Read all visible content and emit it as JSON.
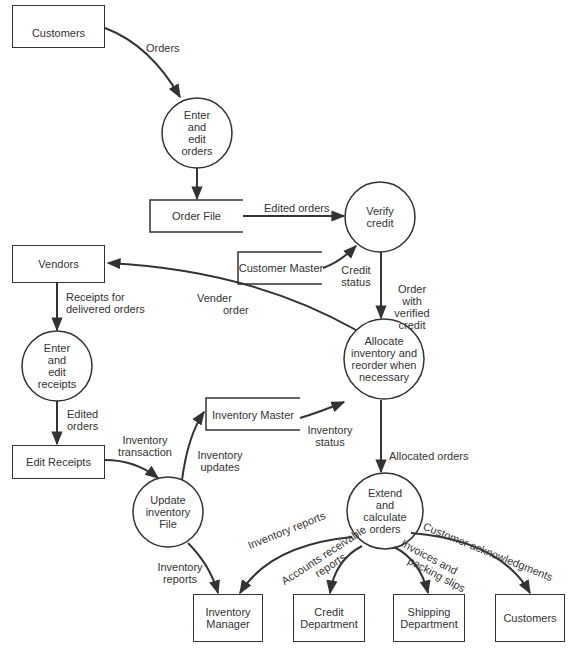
{
  "diagram": {
    "type": "data-flow-diagram",
    "external_entities": [
      {
        "id": "customers_top",
        "label": "Customers"
      },
      {
        "id": "vendors",
        "label": "Vendors"
      },
      {
        "id": "edit_receipts",
        "label": "Edit Receipts"
      },
      {
        "id": "inventory_manager",
        "label": "Inventory\nManager"
      },
      {
        "id": "credit_department",
        "label": "Credit\nDepartment"
      },
      {
        "id": "shipping_department",
        "label": "Shipping\nDepartment"
      },
      {
        "id": "customers_bottom",
        "label": "Customers"
      }
    ],
    "processes": [
      {
        "id": "enter_edit_orders",
        "label": "Enter\nand\nedit\norders"
      },
      {
        "id": "verify_credit",
        "label": "Verify\ncredit"
      },
      {
        "id": "enter_edit_receipts",
        "label": "Enter\nand\nedit\nreceipts"
      },
      {
        "id": "allocate_inventory",
        "label": "Allocate\ninventory and\nreorder when\nnecessary"
      },
      {
        "id": "update_inventory",
        "label": "Update\ninventory\nFile"
      },
      {
        "id": "extend_calculate",
        "label": "Extend\nand\ncalculate\norders"
      }
    ],
    "data_stores": [
      {
        "id": "order_file",
        "label": "Order File"
      },
      {
        "id": "customer_master",
        "label": "Customer Master"
      },
      {
        "id": "inventory_master",
        "label": "Inventory Master"
      }
    ],
    "flows": [
      {
        "from": "customers_top",
        "to": "enter_edit_orders",
        "label": "Orders"
      },
      {
        "from": "enter_edit_orders",
        "to": "order_file",
        "label": ""
      },
      {
        "from": "order_file",
        "to": "verify_credit",
        "label": "Edited orders"
      },
      {
        "from": "customer_master",
        "to": "verify_credit",
        "label": "Credit\nstatus"
      },
      {
        "from": "verify_credit",
        "to": "allocate_inventory",
        "label": "Order\nwith\nverified\ncredit"
      },
      {
        "from": "allocate_inventory",
        "to": "vendors",
        "label": "Vender\norder"
      },
      {
        "from": "vendors",
        "to": "enter_edit_receipts",
        "label": "Receipts for\ndelivered orders"
      },
      {
        "from": "enter_edit_receipts",
        "to": "edit_receipts",
        "label": "Edited\norders"
      },
      {
        "from": "edit_receipts",
        "to": "update_inventory",
        "label": "Inventory\ntransaction"
      },
      {
        "from": "update_inventory",
        "to": "inventory_master",
        "label": "Inventory\nupdates"
      },
      {
        "from": "inventory_master",
        "to": "allocate_inventory",
        "label": "Inventory\nstatus"
      },
      {
        "from": "allocate_inventory",
        "to": "extend_calculate",
        "label": "Allocated orders"
      },
      {
        "from": "update_inventory",
        "to": "inventory_manager",
        "label": "Inventory\nreports"
      },
      {
        "from": "extend_calculate",
        "to": "inventory_manager",
        "label": "Inventory reports"
      },
      {
        "from": "extend_calculate",
        "to": "credit_department",
        "label": "Accounts receivable\nreports"
      },
      {
        "from": "extend_calculate",
        "to": "shipping_department",
        "label": "Invoices and\npacking slips"
      },
      {
        "from": "extend_calculate",
        "to": "customers_bottom",
        "label": "Customer acknowledgments"
      }
    ]
  },
  "labels": {
    "customers_top": "Customers",
    "enter_edit_orders": "Enter\nand\nedit\norders",
    "order_file": "Order File",
    "verify_credit": "Verify\ncredit",
    "customer_master": "Customer Master",
    "vendors": "Vendors",
    "enter_edit_receipts": "Enter\nand\nedit\nreceipts",
    "allocate_inventory": "Allocate\ninventory and\nreorder when\nnecessary",
    "inventory_master": "Inventory Master",
    "edit_receipts": "Edit Receipts",
    "update_inventory": "Update\ninventory\nFile",
    "extend_calculate": "Extend\nand\ncalculate\norders",
    "inventory_manager": "Inventory\nManager",
    "credit_department": "Credit\nDepartment",
    "shipping_department": "Shipping\nDepartment",
    "customers_bottom": "Customers",
    "flow_orders": "Orders",
    "flow_edited_orders": "Edited orders",
    "flow_credit_status_1": "Credit",
    "flow_credit_status_2": "status",
    "flow_order_verified_1": "Order",
    "flow_order_verified_2": "with",
    "flow_order_verified_3": "verified",
    "flow_order_verified_4": "credit",
    "flow_vender_order_1": "Vender",
    "flow_vender_order_2": "order",
    "flow_receipts_1": "Receipts for",
    "flow_receipts_2": "delivered orders",
    "flow_edited_orders2_1": "Edited",
    "flow_edited_orders2_2": "orders",
    "flow_inv_transaction_1": "Inventory",
    "flow_inv_transaction_2": "transaction",
    "flow_inv_updates_1": "Inventory",
    "flow_inv_updates_2": "updates",
    "flow_inv_status_1": "Inventory",
    "flow_inv_status_2": "status",
    "flow_allocated_orders": "Allocated orders",
    "flow_inv_reports_left_1": "Inventory",
    "flow_inv_reports_left_2": "reports",
    "flow_inv_reports_curve": "Inventory  reports",
    "flow_ar_reports_1": "Accounts receivable",
    "flow_ar_reports_2": "reports",
    "flow_invoices_1": "Invoices and",
    "flow_invoices_2": "packing slips",
    "flow_customer_ack": "Customer  acknowledgments"
  }
}
